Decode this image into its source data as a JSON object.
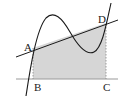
{
  "diagram": {
    "type": "cubic-curve-with-secant-and-shaded-region",
    "points": [
      {
        "id": "A",
        "label": "A"
      },
      {
        "id": "B",
        "label": "B"
      },
      {
        "id": "C",
        "label": "C"
      },
      {
        "id": "D",
        "label": "D"
      }
    ],
    "colors": {
      "shade": "#d6d6d6",
      "stroke": "#1a1a1a",
      "axis": "#9a9a9a",
      "dashed": "#888888"
    }
  }
}
